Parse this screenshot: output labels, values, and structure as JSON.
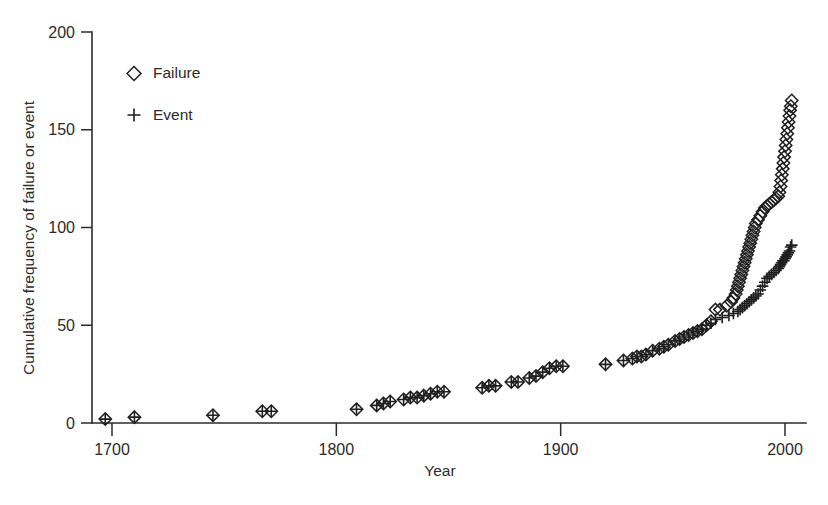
{
  "chart_data": {
    "type": "scatter",
    "title": "",
    "xlabel": "Year",
    "ylabel": "Cumulative frequency of failure or event",
    "xlim": [
      1688,
      2012
    ],
    "ylim": [
      0,
      200
    ],
    "xticks": [
      1700,
      1800,
      1900,
      2000
    ],
    "yticks": [
      0,
      50,
      100,
      150,
      200
    ],
    "xtick_labels": [
      "1700",
      "1800",
      "1900",
      "2000"
    ],
    "ytick_labels": [
      "0",
      "50",
      "100",
      "150",
      "200"
    ],
    "grid": false,
    "legend_position": "upper-left-inside",
    "series": [
      {
        "name": "Failure",
        "marker": "diamond",
        "marker_style": "open",
        "color": "#1f1f1f",
        "points": [
          [
            1697,
            2
          ],
          [
            1710,
            3
          ],
          [
            1745,
            4
          ],
          [
            1767,
            6
          ],
          [
            1771,
            6
          ],
          [
            1809,
            7
          ],
          [
            1818,
            9
          ],
          [
            1821,
            10
          ],
          [
            1824,
            11
          ],
          [
            1830,
            12
          ],
          [
            1833,
            13
          ],
          [
            1836,
            13
          ],
          [
            1839,
            14
          ],
          [
            1842,
            15
          ],
          [
            1845,
            16
          ],
          [
            1848,
            16
          ],
          [
            1865,
            18
          ],
          [
            1868,
            19
          ],
          [
            1871,
            19
          ],
          [
            1878,
            21
          ],
          [
            1881,
            21
          ],
          [
            1886,
            23
          ],
          [
            1889,
            24
          ],
          [
            1892,
            26
          ],
          [
            1895,
            28
          ],
          [
            1898,
            29
          ],
          [
            1901,
            29
          ],
          [
            1920,
            30
          ],
          [
            1928,
            32
          ],
          [
            1932,
            33
          ],
          [
            1934,
            34
          ],
          [
            1936,
            34
          ],
          [
            1938,
            35
          ],
          [
            1941,
            37
          ],
          [
            1944,
            38
          ],
          [
            1946,
            39
          ],
          [
            1948,
            40
          ],
          [
            1951,
            42
          ],
          [
            1953,
            43
          ],
          [
            1955,
            44
          ],
          [
            1957,
            45
          ],
          [
            1959,
            46
          ],
          [
            1961,
            47
          ],
          [
            1963,
            48
          ],
          [
            1965,
            50
          ],
          [
            1967,
            52
          ],
          [
            1969,
            58
          ],
          [
            1971,
            58
          ],
          [
            1974,
            60
          ],
          [
            1976,
            62
          ],
          [
            1977,
            64
          ],
          [
            1978,
            66
          ],
          [
            1978.5,
            68
          ],
          [
            1979,
            70
          ],
          [
            1979.5,
            72
          ],
          [
            1980,
            74
          ],
          [
            1980.5,
            76
          ],
          [
            1981,
            78
          ],
          [
            1981.5,
            80
          ],
          [
            1982,
            82
          ],
          [
            1982.5,
            84
          ],
          [
            1983,
            86
          ],
          [
            1983.5,
            88
          ],
          [
            1984,
            90
          ],
          [
            1984.5,
            92
          ],
          [
            1985,
            94
          ],
          [
            1985.5,
            96
          ],
          [
            1986,
            98
          ],
          [
            1986.5,
            100
          ],
          [
            1987,
            102
          ],
          [
            1988,
            104
          ],
          [
            1989,
            106
          ],
          [
            1990,
            108
          ],
          [
            1991,
            110
          ],
          [
            1992,
            111
          ],
          [
            1993,
            112
          ],
          [
            1994,
            113
          ],
          [
            1995,
            114
          ],
          [
            1996,
            115
          ],
          [
            1997,
            116
          ],
          [
            1997.5,
            118
          ],
          [
            1998,
            121
          ],
          [
            1998.3,
            124
          ],
          [
            1998.6,
            127
          ],
          [
            1999,
            130
          ],
          [
            1999.3,
            133
          ],
          [
            1999.6,
            136
          ],
          [
            2000,
            139
          ],
          [
            2000.3,
            142
          ],
          [
            2000.6,
            145
          ],
          [
            2001,
            148
          ],
          [
            2001.3,
            151
          ],
          [
            2001.6,
            154
          ],
          [
            2002,
            157
          ],
          [
            2002.3,
            160
          ],
          [
            2002.6,
            162
          ],
          [
            2003,
            165
          ]
        ]
      },
      {
        "name": "Event",
        "marker": "plus",
        "marker_style": "line",
        "color": "#1f1f1f",
        "points": [
          [
            1697,
            2
          ],
          [
            1710,
            3
          ],
          [
            1745,
            4
          ],
          [
            1767,
            6
          ],
          [
            1771,
            6
          ],
          [
            1809,
            7
          ],
          [
            1818,
            9
          ],
          [
            1821,
            10
          ],
          [
            1824,
            11
          ],
          [
            1830,
            12
          ],
          [
            1833,
            13
          ],
          [
            1836,
            13
          ],
          [
            1839,
            14
          ],
          [
            1842,
            15
          ],
          [
            1845,
            16
          ],
          [
            1848,
            16
          ],
          [
            1865,
            18
          ],
          [
            1868,
            19
          ],
          [
            1871,
            19
          ],
          [
            1878,
            21
          ],
          [
            1881,
            21
          ],
          [
            1886,
            23
          ],
          [
            1889,
            24
          ],
          [
            1892,
            26
          ],
          [
            1895,
            28
          ],
          [
            1898,
            29
          ],
          [
            1901,
            29
          ],
          [
            1920,
            30
          ],
          [
            1928,
            32
          ],
          [
            1932,
            33
          ],
          [
            1934,
            34
          ],
          [
            1936,
            34
          ],
          [
            1938,
            35
          ],
          [
            1941,
            37
          ],
          [
            1944,
            38
          ],
          [
            1946,
            39
          ],
          [
            1948,
            40
          ],
          [
            1951,
            42
          ],
          [
            1953,
            43
          ],
          [
            1955,
            44
          ],
          [
            1957,
            45
          ],
          [
            1959,
            46
          ],
          [
            1961,
            47
          ],
          [
            1963,
            48
          ],
          [
            1965,
            50
          ],
          [
            1967,
            51
          ],
          [
            1969,
            53
          ],
          [
            1972,
            54
          ],
          [
            1975,
            55
          ],
          [
            1977,
            56
          ],
          [
            1979,
            57
          ],
          [
            1980,
            58
          ],
          [
            1981,
            59
          ],
          [
            1982,
            60
          ],
          [
            1983,
            61
          ],
          [
            1984,
            62
          ],
          [
            1985,
            63
          ],
          [
            1986,
            64
          ],
          [
            1987,
            65
          ],
          [
            1988,
            66
          ],
          [
            1989,
            68
          ],
          [
            1990,
            70
          ],
          [
            1991,
            72
          ],
          [
            1992,
            74
          ],
          [
            1993,
            75
          ],
          [
            1994,
            76
          ],
          [
            1995,
            77
          ],
          [
            1996,
            78
          ],
          [
            1997,
            79
          ],
          [
            1997.5,
            80
          ],
          [
            1998,
            81
          ],
          [
            1998.5,
            82
          ],
          [
            1999,
            83
          ],
          [
            1999.5,
            83
          ],
          [
            2000,
            84
          ],
          [
            2000.5,
            85
          ],
          [
            2001,
            86
          ],
          [
            2001.5,
            87
          ],
          [
            2002,
            88
          ],
          [
            2002.5,
            90
          ],
          [
            2003,
            91
          ]
        ]
      }
    ]
  },
  "legend": {
    "entries": [
      {
        "label": "Failure",
        "marker": "diamond"
      },
      {
        "label": "Event",
        "marker": "plus"
      }
    ]
  }
}
